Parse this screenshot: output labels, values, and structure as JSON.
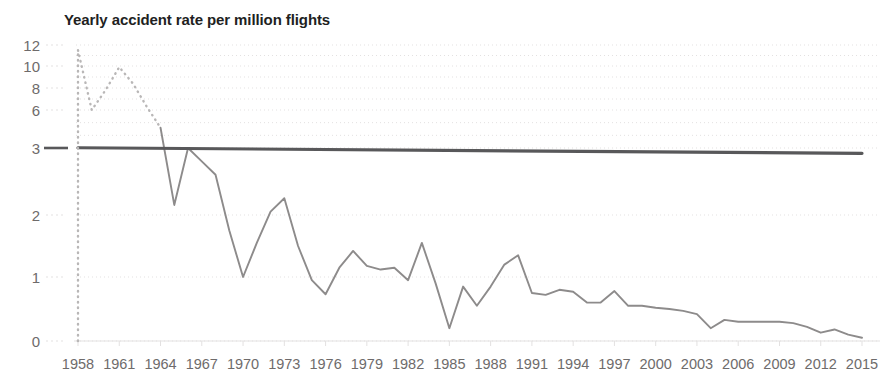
{
  "chart_data": {
    "type": "line",
    "title": "Yearly accident rate per million flights",
    "xlabel": "",
    "ylabel": "",
    "grid": true,
    "legend_position": "none",
    "y_scale": "piecewise-compressed",
    "y_ticks": [
      0,
      1,
      2,
      3,
      6,
      8,
      10,
      12
    ],
    "y_tick_labels": [
      "0",
      "1",
      "2",
      "3",
      "6",
      "8",
      "10",
      "12"
    ],
    "ylim": [
      0,
      12
    ],
    "x_ticks": [
      1958,
      1961,
      1964,
      1967,
      1970,
      1973,
      1976,
      1979,
      1982,
      1985,
      1988,
      1991,
      1994,
      1997,
      2000,
      2003,
      2006,
      2009,
      2012,
      2015
    ],
    "x_tick_labels": [
      "1958",
      "1961",
      "1964",
      "1967",
      "1970",
      "1973",
      "1976",
      "1979",
      "1982",
      "1985",
      "1988",
      "1991",
      "1994",
      "1997",
      "2000",
      "2003",
      "2006",
      "2009",
      "2012",
      "2015"
    ],
    "xlim": [
      1958,
      2015
    ],
    "series": [
      {
        "name": "Yearly accident rate (early, estimated)",
        "style": "dotted",
        "color": "#b9b7b7",
        "x": [
          1958,
          1959,
          1960,
          1961,
          1962,
          1963,
          1964
        ],
        "values": [
          11.5,
          6.0,
          7.8,
          9.9,
          8.4,
          6.3,
          4.6
        ]
      },
      {
        "name": "Yearly accident rate (measured)",
        "style": "solid",
        "color": "#8d8b8b",
        "x": [
          1964,
          1965,
          1966,
          1967,
          1968,
          1969,
          1970,
          1971,
          1972,
          1973,
          1974,
          1975,
          1976,
          1977,
          1978,
          1979,
          1980,
          1981,
          1982,
          1983,
          1984,
          1985,
          1986,
          1987,
          1988,
          1989,
          1990,
          1991,
          1992,
          1993,
          1994,
          1995,
          1996,
          1997,
          1998,
          1999,
          2000,
          2001,
          2002,
          2003,
          2004,
          2005,
          2006,
          2007,
          2008,
          2009,
          2010,
          2011,
          2012,
          2013,
          2014,
          2015
        ],
        "values": [
          4.6,
          2.15,
          3.0,
          2.8,
          2.6,
          1.75,
          1.0,
          1.55,
          2.05,
          2.25,
          1.5,
          0.95,
          0.73,
          1.15,
          1.42,
          1.18,
          1.12,
          1.15,
          0.95,
          1.55,
          0.9,
          0.2,
          0.85,
          0.55,
          0.85,
          1.2,
          1.35,
          0.75,
          0.72,
          0.8,
          0.77,
          0.6,
          0.6,
          0.78,
          0.55,
          0.55,
          0.52,
          0.5,
          0.47,
          0.42,
          0.2,
          0.33,
          0.3,
          0.3,
          0.3,
          0.3,
          0.28,
          0.22,
          0.13,
          0.18,
          0.1,
          0.05
        ]
      },
      {
        "name": "Reference trend line (value 3)",
        "style": "solid-thick",
        "color": "#58585a",
        "x": [
          1958,
          2015
        ],
        "values": [
          3.02,
          2.92
        ]
      }
    ]
  },
  "axes": {
    "y_tick_pixels": [
      341,
      277,
      215,
      148,
      110,
      88,
      66,
      45
    ],
    "plot_left": 78,
    "plot_right": 862,
    "plot_top": 42,
    "plot_bottom": 341
  },
  "colors": {
    "title": "#221f1f",
    "tick": "#6e6b6b",
    "gridline": "#e3e1e1",
    "series_solid": "#8d8b8b",
    "series_dotted": "#b9b7b7",
    "reference_line": "#58585a",
    "background": "#ffffff"
  }
}
